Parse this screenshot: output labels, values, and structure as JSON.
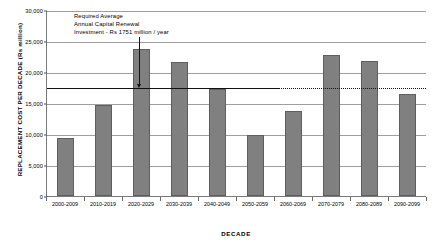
{
  "chart_data": {
    "type": "bar",
    "title": "",
    "xlabel": "DECADE",
    "ylabel": "REPLACEMENT COST PER DECADE (Rs million)",
    "ylim": [
      0,
      30000
    ],
    "ytick_values": [
      30000,
      25000,
      20000,
      15000,
      10000,
      5000,
      0
    ],
    "ytick_labels": [
      "30,000",
      "25,000",
      "20,000",
      "15,000",
      "10,000",
      "5,000",
      "0"
    ],
    "grid": true,
    "legend": "none",
    "categories": [
      "2000-2009",
      "2010-2019",
      "2020-2029",
      "2030-2039",
      "2040-2049",
      "2050-2059",
      "2060-2069",
      "2070-2079",
      "2080-2089",
      "2090-2099"
    ],
    "values": [
      9400,
      14600,
      23700,
      21600,
      17300,
      9900,
      13700,
      22800,
      21700,
      16500
    ],
    "annotations": [
      {
        "name": "required-average-investment",
        "lines": [
          "Required Average",
          "Annual Capital Renewal",
          "Investment - Rs 1751 million / year"
        ],
        "reference_line_value": 17510
      }
    ]
  },
  "colors": {
    "bar_fill": "#808080",
    "bar_border": "#5e5e5e",
    "gridline": "#9e9e9e",
    "axis": "#7a7a7a",
    "annotation_line": "#111111"
  }
}
